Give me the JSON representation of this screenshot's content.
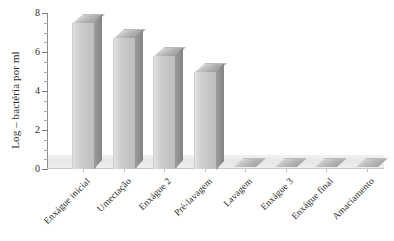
{
  "chart_data": {
    "type": "bar",
    "title": "",
    "xlabel": "",
    "ylabel": "Log – bactéria por ml",
    "ylim": [
      0,
      8
    ],
    "ytick_labels": [
      "0",
      "2",
      "4",
      "6",
      "8"
    ],
    "ytick_values": [
      0,
      2,
      4,
      6,
      8
    ],
    "minor_tick_step": 0.5,
    "grid": false,
    "legend": null,
    "style_3d": true,
    "categories": [
      "Enxágue inicial",
      "Umectação",
      "Enxágue 2",
      "Pré-lavagem",
      "Lavagem",
      "Enxágue 3",
      "Enxágue final",
      "Amaciamento"
    ],
    "values": [
      7.5,
      6.7,
      5.8,
      5.0,
      0.1,
      0.1,
      0.1,
      0.1
    ],
    "bar_color_front": "#c6c6c6",
    "bar_color_side": "#8d8d8d",
    "bar_color_top": "#b0b0b0",
    "background_color": "#ffffff",
    "axis_color": "#8c8c8c",
    "text_color": "#2b2b2b"
  }
}
